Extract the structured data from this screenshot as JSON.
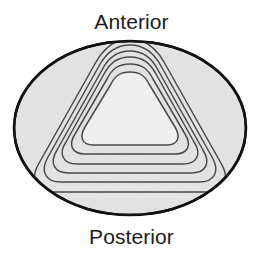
{
  "figure": {
    "title_top": "Anterior",
    "title_bottom": "Posterior",
    "colors": {
      "background": "#ffffff",
      "ellipse_fill": "#e4e4e4",
      "ellipse_stroke": "#111111",
      "inner_fill": "#efefef",
      "contour_stroke": "#4a4a4a",
      "label_text": "#1b1b1b"
    },
    "ellipse": {
      "cx": 130,
      "cy": 128,
      "rx": 117,
      "ry": 88,
      "stroke_width": 2.6
    },
    "contours": {
      "count": 6,
      "shape": "rounded-triangle",
      "stroke_width": 1.5,
      "scales": [
        1.0,
        0.87,
        0.745,
        0.62,
        0.5,
        0.385
      ]
    },
    "labels": {
      "anterior": "Anterior",
      "posterior": "Posterior"
    }
  }
}
